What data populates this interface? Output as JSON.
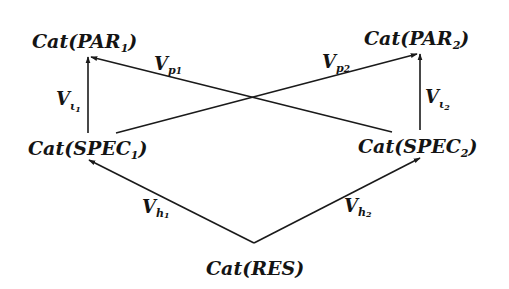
{
  "diagram": {
    "type": "commutative-diagram",
    "stroke_color": "#1a1a1a",
    "text_color": "#141414",
    "background": "#ffffff",
    "nodes": [
      {
        "id": "par1",
        "base": "Cat(PAR",
        "sub": "1",
        "close": ")"
      },
      {
        "id": "par2",
        "base": "Cat(PAR",
        "sub": "2",
        "close": ")"
      },
      {
        "id": "spec1",
        "base": "Cat(SPEC",
        "sub": "1",
        "close": ")"
      },
      {
        "id": "spec2",
        "base": "Cat(SPEC",
        "sub": "2",
        "close": ")"
      },
      {
        "id": "res",
        "base": "Cat(RES)",
        "sub": "",
        "close": ""
      }
    ],
    "edges": [
      {
        "id": "v_i1",
        "from": "spec1",
        "to": "par1",
        "label": "V",
        "sub": "ι",
        "subsub": "1"
      },
      {
        "id": "v_i2",
        "from": "spec2",
        "to": "par2",
        "label": "V",
        "sub": "ι",
        "subsub": "2"
      },
      {
        "id": "v_p1",
        "from": "spec2",
        "to": "par1",
        "label": "V",
        "sub": "p",
        "subsub": "1"
      },
      {
        "id": "v_p2",
        "from": "spec1",
        "to": "par2",
        "label": "V",
        "sub": "p",
        "subsub": "2"
      },
      {
        "id": "v_h1",
        "from": "res",
        "to": "spec1",
        "label": "V",
        "sub": "h",
        "subsub": "1"
      },
      {
        "id": "v_h2",
        "from": "res",
        "to": "spec2",
        "label": "V",
        "sub": "h",
        "subsub": "2"
      }
    ]
  }
}
